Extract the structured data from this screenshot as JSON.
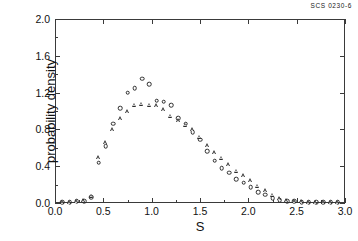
{
  "corner_code": "SCS 0230-6",
  "chart_data": {
    "type": "scatter",
    "title": "",
    "xlabel": "S",
    "ylabel": "probability density",
    "xlim": [
      0.0,
      3.0
    ],
    "ylim": [
      0.0,
      2.0
    ],
    "xticks": [
      "0.0",
      "0.5",
      "1.0",
      "1.5",
      "2.0",
      "2.5",
      "3.0"
    ],
    "xtick_values": [
      0.0,
      0.5,
      1.0,
      1.5,
      2.0,
      2.5,
      3.0
    ],
    "yticks": [
      "0.0",
      "0.4",
      "0.8",
      "1.2",
      "1.6",
      "2.0"
    ],
    "ytick_values": [
      0.0,
      0.4,
      0.8,
      1.2,
      1.6,
      2.0
    ],
    "grid": false,
    "legend": "none",
    "series": [
      {
        "name": "circles",
        "marker": "circle",
        "x": [
          0.075,
          0.15,
          0.225,
          0.3,
          0.375,
          0.45,
          0.525,
          0.6,
          0.675,
          0.75,
          0.825,
          0.9,
          0.975,
          1.05,
          1.125,
          1.2,
          1.275,
          1.35,
          1.425,
          1.5,
          1.575,
          1.65,
          1.725,
          1.8,
          1.875,
          1.95,
          2.025,
          2.1,
          2.175,
          2.25,
          2.325,
          2.4,
          2.475,
          2.55,
          2.625,
          2.7,
          2.775,
          2.85,
          2.925
        ],
        "y": [
          0.01,
          0.01,
          0.02,
          0.02,
          0.06,
          0.44,
          0.62,
          0.86,
          1.03,
          1.2,
          1.25,
          1.35,
          1.29,
          1.11,
          1.1,
          1.06,
          0.92,
          0.86,
          0.77,
          0.69,
          0.56,
          0.46,
          0.38,
          0.33,
          0.26,
          0.22,
          0.17,
          0.12,
          0.09,
          0.05,
          0.03,
          0.02,
          0.02,
          0.01,
          0.01,
          0.01,
          0.01,
          0.01,
          0.01
        ]
      },
      {
        "name": "triangles",
        "marker": "triangle",
        "x": [
          0.075,
          0.15,
          0.225,
          0.3,
          0.375,
          0.45,
          0.525,
          0.6,
          0.675,
          0.75,
          0.825,
          0.9,
          0.975,
          1.05,
          1.125,
          1.2,
          1.275,
          1.35,
          1.425,
          1.5,
          1.575,
          1.65,
          1.725,
          1.8,
          1.875,
          1.95,
          2.025,
          2.1,
          2.175,
          2.25,
          2.325,
          2.4,
          2.475,
          2.55,
          2.625,
          2.7,
          2.775,
          2.85,
          2.925
        ],
        "y": [
          0.01,
          0.01,
          0.02,
          0.03,
          0.08,
          0.5,
          0.66,
          0.8,
          0.92,
          1.0,
          1.07,
          1.08,
          1.07,
          1.06,
          1.02,
          0.95,
          0.9,
          0.85,
          0.8,
          0.72,
          0.63,
          0.55,
          0.49,
          0.42,
          0.35,
          0.3,
          0.25,
          0.19,
          0.14,
          0.09,
          0.05,
          0.03,
          0.02,
          0.02,
          0.01,
          0.01,
          0.01,
          0.01,
          0.01
        ]
      }
    ]
  }
}
